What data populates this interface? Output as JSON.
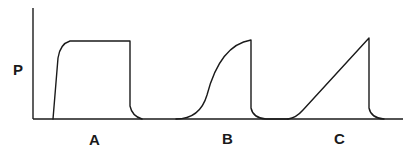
{
  "diagram": {
    "axis_label_y": "P",
    "waveforms": [
      {
        "label": "A",
        "shape": "square"
      },
      {
        "label": "B",
        "shape": "sine-like ascending"
      },
      {
        "label": "C",
        "shape": "ramp"
      }
    ],
    "colors": {
      "ink": "#1a1a1a",
      "background": "#ffffff"
    }
  }
}
